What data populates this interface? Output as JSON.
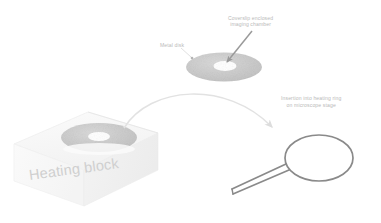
{
  "figure": {
    "background_color": "#ffffff",
    "width": 381,
    "height": 223
  },
  "labels": {
    "chamber_line1": "Coverslip enclosed",
    "chamber_line2": "imaging chamber",
    "metal_disk": "Metal disk",
    "insertion_line1": "Insertion into heating ring",
    "insertion_line2": "on microscope stage",
    "heating_block": "Heating block"
  },
  "colors": {
    "disk_fill": "#c9c9c9",
    "disk_hole": "#ffffff",
    "block_face": "#f7f7f7",
    "block_edge": "#e3e3e3",
    "ring_stroke": "#8a8a8a",
    "dark_arrow": "#9a9a9a",
    "curved_arrow": "#e0e0e0",
    "callout_text": "#b9b9b9",
    "heading_text": "#cfcfcf"
  },
  "elements": {
    "top_disk": {
      "name": "Coverslip enclosed imaging chamber (metal disk, exploded view)",
      "cx": 224,
      "cy": 67,
      "rx": 38,
      "ry": 14,
      "hole_rx": 11,
      "hole_ry": 4.5
    },
    "block_disk": {
      "name": "Metal disk seated on heating block",
      "cx": 99,
      "cy": 137,
      "rx": 38,
      "ry": 14,
      "hole_rx": 11,
      "hole_ry": 4.5
    },
    "heating_block": {
      "name": "Heating block (isometric cube)"
    },
    "heating_ring": {
      "name": "Heating ring on microscope stage",
      "cx": 319,
      "cy": 158,
      "rx": 34,
      "ry": 23
    },
    "curved_arrow": {
      "name": "Transfer arc from heating block to heating ring"
    },
    "pointer_arrow": {
      "name": "Pointer arrow to imaging chamber aperture"
    },
    "leader_line": {
      "name": "Leader line to metal disk"
    }
  }
}
